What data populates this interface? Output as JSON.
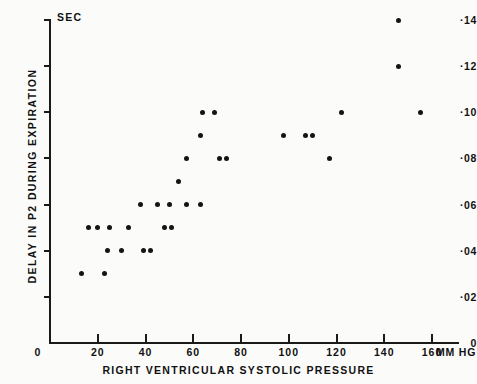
{
  "figure": {
    "background_color": "#fbfbfa",
    "ink_color": "#141414"
  },
  "axes": {
    "y_title": "DELAY IN P2 DURING EXPIRATION",
    "y_unit_label": "SEC",
    "x_title": "RIGHT VENTRICULAR SYSTOLIC PRESSURE",
    "x_unit_label": "MM HG",
    "y_ticks": [
      {
        "value": 0.14,
        "label": "·14"
      },
      {
        "value": 0.12,
        "label": "·12"
      },
      {
        "value": 0.1,
        "label": "·10"
      },
      {
        "value": 0.08,
        "label": "·08"
      },
      {
        "value": 0.06,
        "label": "·06"
      },
      {
        "value": 0.04,
        "label": "·04"
      },
      {
        "value": 0.02,
        "label": "·02"
      },
      {
        "value": 0.0,
        "label": "0"
      }
    ],
    "x_ticks": [
      {
        "value": 0,
        "label": "0"
      },
      {
        "value": 20,
        "label": "20"
      },
      {
        "value": 40,
        "label": "40"
      },
      {
        "value": 60,
        "label": "60"
      },
      {
        "value": 80,
        "label": "80"
      },
      {
        "value": 100,
        "label": "100"
      },
      {
        "value": 120,
        "label": "120"
      },
      {
        "value": 140,
        "label": "140"
      },
      {
        "value": 160,
        "label": "160"
      }
    ]
  },
  "chart_data": {
    "type": "scatter",
    "title": "",
    "xlabel": "RIGHT VENTRICULAR SYSTOLIC PRESSURE",
    "ylabel": "DELAY IN P2 DURING EXPIRATION",
    "x_unit": "MM HG",
    "y_unit": "SEC",
    "xlim": [
      0,
      168
    ],
    "ylim": [
      0,
      0.145
    ],
    "grid": false,
    "legend": null,
    "series": [
      {
        "name": "patients",
        "marker": "filled-circle",
        "color": "#141414",
        "points": [
          [
            13,
            0.03
          ],
          [
            23,
            0.03
          ],
          [
            16,
            0.05
          ],
          [
            20,
            0.05
          ],
          [
            25,
            0.05
          ],
          [
            33,
            0.05
          ],
          [
            24,
            0.04
          ],
          [
            30,
            0.04
          ],
          [
            39,
            0.04
          ],
          [
            42,
            0.04
          ],
          [
            38,
            0.06
          ],
          [
            45,
            0.06
          ],
          [
            50,
            0.06
          ],
          [
            57,
            0.06
          ],
          [
            63,
            0.06
          ],
          [
            48,
            0.05
          ],
          [
            51,
            0.05
          ],
          [
            54,
            0.07
          ],
          [
            57,
            0.08
          ],
          [
            71,
            0.08
          ],
          [
            74,
            0.08
          ],
          [
            63,
            0.09
          ],
          [
            64,
            0.1
          ],
          [
            69,
            0.1
          ],
          [
            98,
            0.09
          ],
          [
            107,
            0.09
          ],
          [
            110,
            0.09
          ],
          [
            117,
            0.08
          ],
          [
            122,
            0.1
          ],
          [
            146,
            0.14
          ],
          [
            146,
            0.12
          ],
          [
            155,
            0.1
          ]
        ]
      }
    ]
  }
}
